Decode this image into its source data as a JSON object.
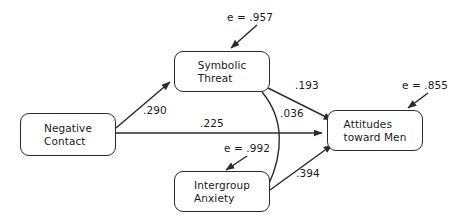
{
  "diagram": {
    "type": "path-analysis-model",
    "nodes": [
      {
        "id": "negative-contact",
        "line1": "Negative",
        "line2": "Contact",
        "x": 20,
        "y": 113,
        "w": 96,
        "h": 43
      },
      {
        "id": "symbolic-threat",
        "line1": "Symbolic",
        "line2": "Threat",
        "x": 174,
        "y": 51,
        "w": 96,
        "h": 41
      },
      {
        "id": "intergroup-anxiety",
        "line1": "Intergroup",
        "line2": "Anxiety",
        "x": 174,
        "y": 171,
        "w": 96,
        "h": 41
      },
      {
        "id": "attitudes-toward-men",
        "line1": "Attitudes",
        "line2": "toward Men",
        "x": 327,
        "y": 110,
        "w": 96,
        "h": 41
      }
    ],
    "path_coefficients": [
      {
        "id": "nc-to-st",
        "label": ".290",
        "from": "negative-contact",
        "to": "symbolic-threat",
        "x": 143,
        "y": 104
      },
      {
        "id": "nc-to-atm",
        "label": ".225",
        "from": "negative-contact",
        "to": "attitudes-toward-men",
        "x": 200,
        "y": 117
      },
      {
        "id": "st-to-atm",
        "label": ".193",
        "from": "symbolic-threat",
        "to": "attitudes-toward-men",
        "x": 295,
        "y": 79
      },
      {
        "id": "st-ia-covariance",
        "label": ".036",
        "from": "symbolic-threat",
        "to": "intergroup-anxiety",
        "x": 280,
        "y": 107
      },
      {
        "id": "ia-to-atm",
        "label": ".394",
        "from": "intergroup-anxiety",
        "to": "attitudes-toward-men",
        "x": 296,
        "y": 167
      }
    ],
    "error_terms": [
      {
        "id": "error-symbolic-threat",
        "label": "e = .957",
        "target": "symbolic-threat",
        "x": 227,
        "y": 11
      },
      {
        "id": "error-attitudes",
        "label": "e = .855",
        "target": "attitudes-toward-men",
        "x": 402,
        "y": 79
      },
      {
        "id": "error-intergroup-anxiety",
        "label": "e = .992",
        "target": "intergroup-anxiety",
        "x": 224,
        "y": 142
      }
    ],
    "colors": {
      "stroke": "#2b2b2b",
      "text": "#1a1a1a",
      "background": "#ffffff"
    }
  }
}
